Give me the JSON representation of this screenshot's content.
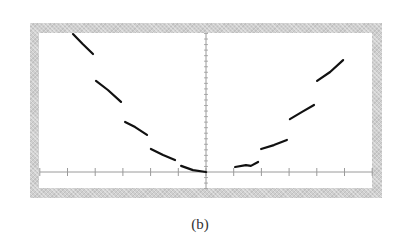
{
  "caption": "(b)",
  "chart_data": {
    "type": "line",
    "title": "",
    "xlabel": "",
    "ylabel": "",
    "xlim": [
      -6.0,
      6.0
    ],
    "ylim": [
      -0.6,
      5.0
    ],
    "x_ticks": [
      -6,
      -5,
      -4,
      -3,
      -2,
      -1,
      0,
      1,
      2,
      3,
      4,
      5,
      6
    ],
    "y_minor_tick_spacing": 0.2,
    "grid": false,
    "legend": null,
    "line_style": "dashed",
    "line_color": "#111111",
    "frame_color": "#cfcfcf",
    "series": [
      {
        "name": "curve",
        "segments": [
          [
            [
              -4.8,
              4.98
            ],
            [
              -4.45,
              4.62
            ],
            [
              -4.08,
              4.26
            ]
          ],
          [
            [
              -3.97,
              3.29
            ],
            [
              -3.54,
              2.96
            ],
            [
              -3.07,
              2.53
            ]
          ],
          [
            [
              -2.92,
              1.81
            ],
            [
              -2.56,
              1.62
            ],
            [
              -2.13,
              1.34
            ]
          ],
          [
            [
              -1.99,
              0.83
            ],
            [
              -1.55,
              0.61
            ],
            [
              -1.12,
              0.43
            ]
          ],
          [
            [
              -0.9,
              0.22
            ],
            [
              -0.47,
              0.07
            ],
            [
              0.0,
              0.0
            ]
          ],
          [
            [
              1.05,
              0.18
            ],
            [
              1.44,
              0.25
            ],
            [
              1.62,
              0.22
            ],
            [
              1.88,
              0.36
            ]
          ],
          [
            [
              1.99,
              0.83
            ],
            [
              2.45,
              0.97
            ],
            [
              2.92,
              1.16
            ]
          ],
          [
            [
              3.03,
              1.91
            ],
            [
              3.47,
              2.17
            ],
            [
              3.9,
              2.42
            ]
          ],
          [
            [
              4.01,
              3.29
            ],
            [
              4.48,
              3.61
            ],
            [
              4.95,
              4.04
            ]
          ]
        ]
      }
    ]
  }
}
